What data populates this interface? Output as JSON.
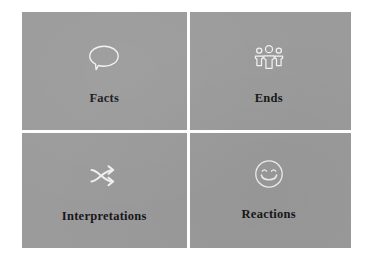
{
  "slide": {
    "background_color": "#ffffff",
    "panel_color": "#9b9b9b",
    "divider_color": "#fdfdfd",
    "icon_color": "#f2f2f2",
    "label_color": "#17171a"
  },
  "quadrants": [
    {
      "label": "Facts",
      "icon": "speech-bubble-icon",
      "position": "top-left"
    },
    {
      "label": "Ends",
      "icon": "group-of-people-icon",
      "position": "top-right"
    },
    {
      "label": "Interpretations",
      "icon": "shuffle-arrows-icon",
      "position": "bottom-left"
    },
    {
      "label": "Reactions",
      "icon": "smiley-face-icon",
      "position": "bottom-right"
    }
  ]
}
